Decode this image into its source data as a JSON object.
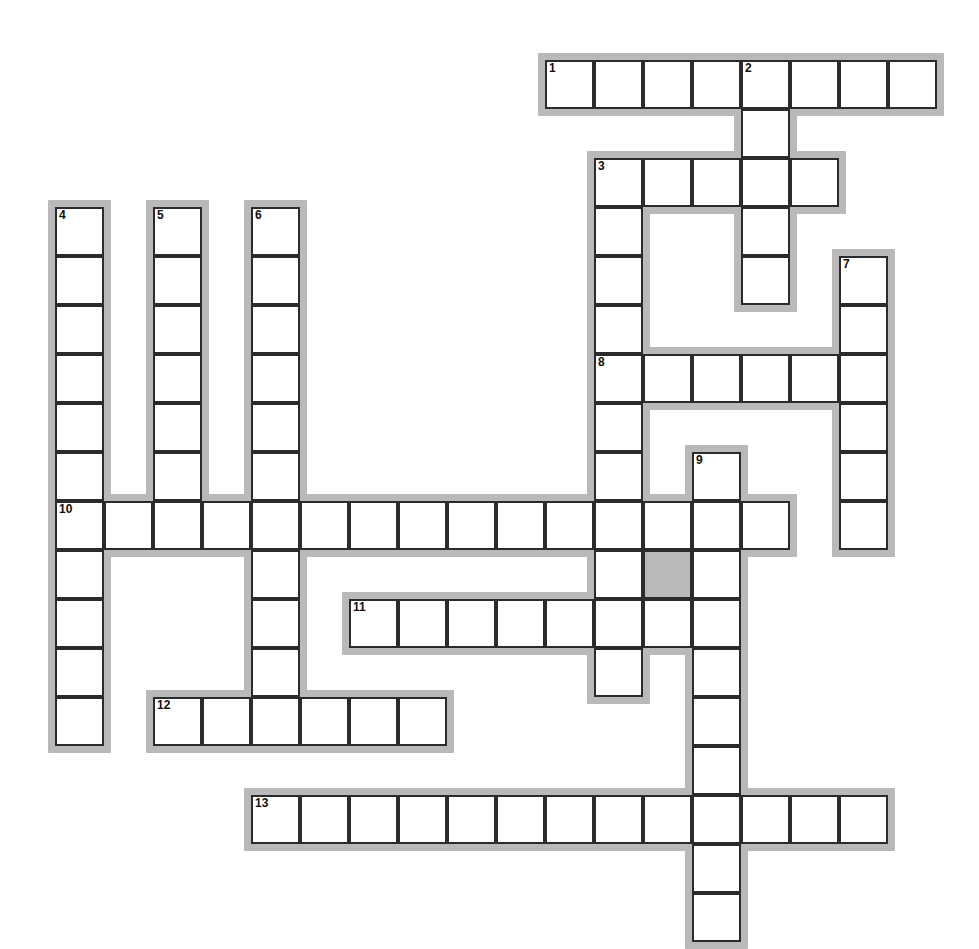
{
  "puzzle": {
    "title": "Crossword Puzzle Grid",
    "kind": "crossword-grid",
    "geometry": {
      "origin_x": 55,
      "origin_y": 60,
      "cell_size": 49,
      "halo_pad": 7,
      "canvas_width": 979,
      "canvas_height": 947
    },
    "colors": {
      "page_background": "#ffffff",
      "cell_fill": "#ffffff",
      "cell_border": "#2b2b2b",
      "halo": "#b9b9b9",
      "shaded_fill": "#b9b9b9",
      "number_text": "#101010"
    },
    "counts": {
      "across_entries": 7,
      "down_entries": 6,
      "total_clue_numbers": 13,
      "shaded_cells": 1
    },
    "entries": [
      {
        "number": "1",
        "direction": "across",
        "col": 10,
        "row": 0,
        "length": 8
      },
      {
        "number": "2",
        "direction": "down",
        "col": 14,
        "row": 0,
        "length": 5
      },
      {
        "number": "3",
        "direction": "across",
        "col": 11,
        "row": 2,
        "length": 5
      },
      {
        "number": "3",
        "direction": "down",
        "col": 11,
        "row": 2,
        "length": 9
      },
      {
        "number": "4",
        "direction": "down",
        "col": 0,
        "row": 3,
        "length": 11
      },
      {
        "number": "5",
        "direction": "down",
        "col": 2,
        "row": 3,
        "length": 7
      },
      {
        "number": "6",
        "direction": "down",
        "col": 4,
        "row": 3,
        "length": 10
      },
      {
        "number": "7",
        "direction": "down",
        "col": 16,
        "row": 4,
        "length": 6
      },
      {
        "number": "8",
        "direction": "across",
        "col": 11,
        "row": 6,
        "length": 6
      },
      {
        "number": "9",
        "direction": "down",
        "col": 13,
        "row": 8,
        "length": 10
      },
      {
        "number": "10",
        "direction": "across",
        "col": 0,
        "row": 9,
        "length": 15
      },
      {
        "number": "11",
        "direction": "across",
        "col": 6,
        "row": 11,
        "length": 8
      },
      {
        "number": "12",
        "direction": "across",
        "col": 2,
        "row": 13,
        "length": 6
      },
      {
        "number": "13",
        "direction": "across",
        "col": 4,
        "row": 15,
        "length": 13
      }
    ],
    "numbered_cells": [
      {
        "label": "1",
        "col": 10,
        "row": 0
      },
      {
        "label": "2",
        "col": 14,
        "row": 0
      },
      {
        "label": "3",
        "col": 11,
        "row": 2
      },
      {
        "label": "4",
        "col": 0,
        "row": 3
      },
      {
        "label": "5",
        "col": 2,
        "row": 3
      },
      {
        "label": "6",
        "col": 4,
        "row": 3
      },
      {
        "label": "7",
        "col": 16,
        "row": 4
      },
      {
        "label": "8",
        "col": 11,
        "row": 6
      },
      {
        "label": "9",
        "col": 13,
        "row": 8
      },
      {
        "label": "10",
        "col": 0,
        "row": 9
      },
      {
        "label": "11",
        "col": 6,
        "row": 11
      },
      {
        "label": "12",
        "col": 2,
        "row": 13
      },
      {
        "label": "13",
        "col": 4,
        "row": 15
      }
    ],
    "shaded_cells": [
      {
        "col": 12,
        "row": 10
      }
    ],
    "cells": [
      {
        "col": 10,
        "row": 0
      },
      {
        "col": 11,
        "row": 0
      },
      {
        "col": 12,
        "row": 0
      },
      {
        "col": 13,
        "row": 0
      },
      {
        "col": 14,
        "row": 0
      },
      {
        "col": 15,
        "row": 0
      },
      {
        "col": 16,
        "row": 0
      },
      {
        "col": 17,
        "row": 0
      },
      {
        "col": 14,
        "row": 1
      },
      {
        "col": 11,
        "row": 2
      },
      {
        "col": 12,
        "row": 2
      },
      {
        "col": 13,
        "row": 2
      },
      {
        "col": 14,
        "row": 2
      },
      {
        "col": 15,
        "row": 2
      },
      {
        "col": 0,
        "row": 3
      },
      {
        "col": 2,
        "row": 3
      },
      {
        "col": 4,
        "row": 3
      },
      {
        "col": 11,
        "row": 3
      },
      {
        "col": 14,
        "row": 3
      },
      {
        "col": 0,
        "row": 4
      },
      {
        "col": 2,
        "row": 4
      },
      {
        "col": 4,
        "row": 4
      },
      {
        "col": 11,
        "row": 4
      },
      {
        "col": 14,
        "row": 4
      },
      {
        "col": 16,
        "row": 4
      },
      {
        "col": 0,
        "row": 5
      },
      {
        "col": 2,
        "row": 5
      },
      {
        "col": 4,
        "row": 5
      },
      {
        "col": 11,
        "row": 5
      },
      {
        "col": 16,
        "row": 5
      },
      {
        "col": 0,
        "row": 6
      },
      {
        "col": 2,
        "row": 6
      },
      {
        "col": 4,
        "row": 6
      },
      {
        "col": 11,
        "row": 6
      },
      {
        "col": 12,
        "row": 6
      },
      {
        "col": 13,
        "row": 6
      },
      {
        "col": 14,
        "row": 6
      },
      {
        "col": 15,
        "row": 6
      },
      {
        "col": 16,
        "row": 6
      },
      {
        "col": 0,
        "row": 7
      },
      {
        "col": 2,
        "row": 7
      },
      {
        "col": 4,
        "row": 7
      },
      {
        "col": 11,
        "row": 7
      },
      {
        "col": 16,
        "row": 7
      },
      {
        "col": 0,
        "row": 8
      },
      {
        "col": 2,
        "row": 8
      },
      {
        "col": 4,
        "row": 8
      },
      {
        "col": 11,
        "row": 8
      },
      {
        "col": 13,
        "row": 8
      },
      {
        "col": 16,
        "row": 8
      },
      {
        "col": 0,
        "row": 9
      },
      {
        "col": 1,
        "row": 9
      },
      {
        "col": 2,
        "row": 9
      },
      {
        "col": 3,
        "row": 9
      },
      {
        "col": 4,
        "row": 9
      },
      {
        "col": 5,
        "row": 9
      },
      {
        "col": 6,
        "row": 9
      },
      {
        "col": 7,
        "row": 9
      },
      {
        "col": 8,
        "row": 9
      },
      {
        "col": 9,
        "row": 9
      },
      {
        "col": 10,
        "row": 9
      },
      {
        "col": 11,
        "row": 9
      },
      {
        "col": 12,
        "row": 9
      },
      {
        "col": 13,
        "row": 9
      },
      {
        "col": 14,
        "row": 9
      },
      {
        "col": 16,
        "row": 9
      },
      {
        "col": 0,
        "row": 10
      },
      {
        "col": 4,
        "row": 10
      },
      {
        "col": 11,
        "row": 10
      },
      {
        "col": 12,
        "row": 10
      },
      {
        "col": 13,
        "row": 10
      },
      {
        "col": 0,
        "row": 11
      },
      {
        "col": 4,
        "row": 11
      },
      {
        "col": 6,
        "row": 11
      },
      {
        "col": 7,
        "row": 11
      },
      {
        "col": 8,
        "row": 11
      },
      {
        "col": 9,
        "row": 11
      },
      {
        "col": 10,
        "row": 11
      },
      {
        "col": 11,
        "row": 11
      },
      {
        "col": 12,
        "row": 11
      },
      {
        "col": 13,
        "row": 11
      },
      {
        "col": 0,
        "row": 12
      },
      {
        "col": 4,
        "row": 12
      },
      {
        "col": 11,
        "row": 12
      },
      {
        "col": 13,
        "row": 12
      },
      {
        "col": 0,
        "row": 13
      },
      {
        "col": 2,
        "row": 13
      },
      {
        "col": 3,
        "row": 13
      },
      {
        "col": 4,
        "row": 13
      },
      {
        "col": 5,
        "row": 13
      },
      {
        "col": 6,
        "row": 13
      },
      {
        "col": 7,
        "row": 13
      },
      {
        "col": 13,
        "row": 13
      },
      {
        "col": 13,
        "row": 14
      },
      {
        "col": 4,
        "row": 15
      },
      {
        "col": 5,
        "row": 15
      },
      {
        "col": 6,
        "row": 15
      },
      {
        "col": 7,
        "row": 15
      },
      {
        "col": 8,
        "row": 15
      },
      {
        "col": 9,
        "row": 15
      },
      {
        "col": 10,
        "row": 15
      },
      {
        "col": 11,
        "row": 15
      },
      {
        "col": 12,
        "row": 15
      },
      {
        "col": 13,
        "row": 15
      },
      {
        "col": 14,
        "row": 15
      },
      {
        "col": 15,
        "row": 15
      },
      {
        "col": 16,
        "row": 15
      },
      {
        "col": 13,
        "row": 16
      },
      {
        "col": 13,
        "row": 17
      }
    ]
  }
}
